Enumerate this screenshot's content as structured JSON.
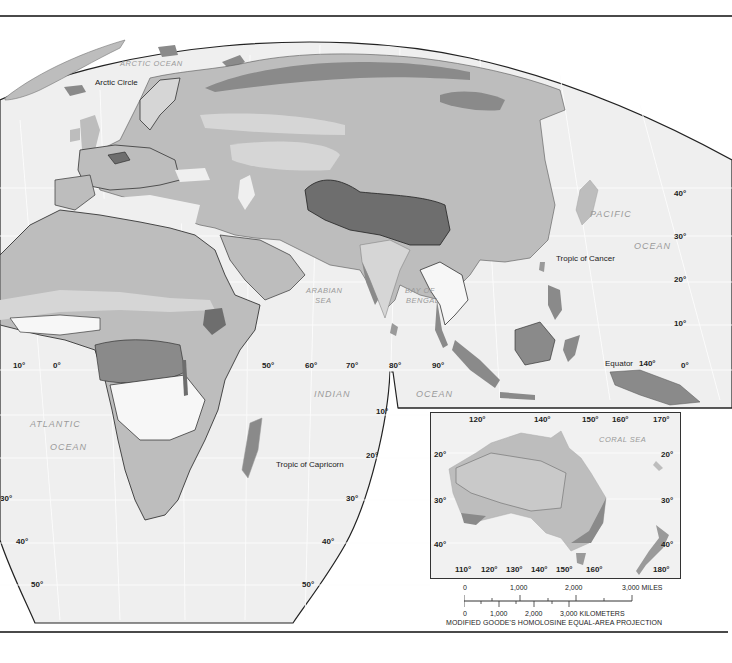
{
  "map": {
    "projection_note": "MODIFIED GOODE'S HOMOLOSINE EQUAL-AREA PROJECTION",
    "colors": {
      "background": "#ffffff",
      "ocean": "#efefef",
      "graticule": "#fbfbfb",
      "land_lightest": "#f7f7f7",
      "land_light": "#d6d6d6",
      "land_medium": "#bdbdbd",
      "land_dark": "#9a9a9a",
      "land_darkest": "#6e6e6e",
      "border": "#222222",
      "frame": "#4a4a4a"
    },
    "water_labels": {
      "arctic_ocean": "ARCTIC OCEAN",
      "pacific": "PACIFIC",
      "pacific_ocean": "OCEAN",
      "arabian_sea_1": "ARABIAN",
      "arabian_sea_2": "SEA",
      "bay_of_bengal_1": "BAY OF",
      "bay_of_bengal_2": "BENGAL",
      "indian": "INDIAN",
      "indian_ocean": "OCEAN",
      "atlantic": "ATLANTIC",
      "atlantic_ocean": "OCEAN",
      "coral_sea": "CORAL SEA"
    },
    "line_labels": {
      "arctic_circle": "Arctic Circle",
      "tropic_of_cancer": "Tropic of Cancer",
      "equator": "Equator",
      "tropic_of_capricorn": "Tropic of Capricorn"
    },
    "longitude_labels": {
      "lon_10w": "10°",
      "lon_0": "0°",
      "lon_50": "50°",
      "lon_60": "60°",
      "lon_70": "70°",
      "lon_80": "80°",
      "lon_90": "90°",
      "lon_140": "140°"
    },
    "latitude_labels_right": {
      "lat_40": "40°",
      "lat_30": "30°",
      "lat_20": "20°",
      "lat_10": "10°",
      "lat_0": "0°"
    },
    "latitude_labels_south": {
      "lat_10_s": "10°",
      "lat_20_s": "20°",
      "lat_30_s_left": "30°",
      "lat_30_s_right": "30°",
      "lat_40_s_left": "40°",
      "lat_40_s_right": "40°",
      "lat_50_s_left": "50°",
      "lat_50_s_right": "50°"
    },
    "inset": {
      "top_longitudes": [
        "120°",
        "140°",
        "150°",
        "160°",
        "170°"
      ],
      "bottom_longitudes": [
        "110°",
        "120°",
        "130°",
        "140°",
        "150°",
        "160°",
        "180°"
      ],
      "left_latitudes": [
        "20°",
        "30°",
        "40°"
      ],
      "right_latitudes": [
        "20°",
        "30°",
        "40°"
      ],
      "sea_label": "CORAL SEA"
    },
    "scale_bar": {
      "miles_ticks": [
        "0",
        "1,000",
        "2,000",
        "3,000 MILES"
      ],
      "km_ticks": [
        "0",
        "1,000",
        "2,000",
        "3,000 KILOMETERS"
      ]
    }
  }
}
